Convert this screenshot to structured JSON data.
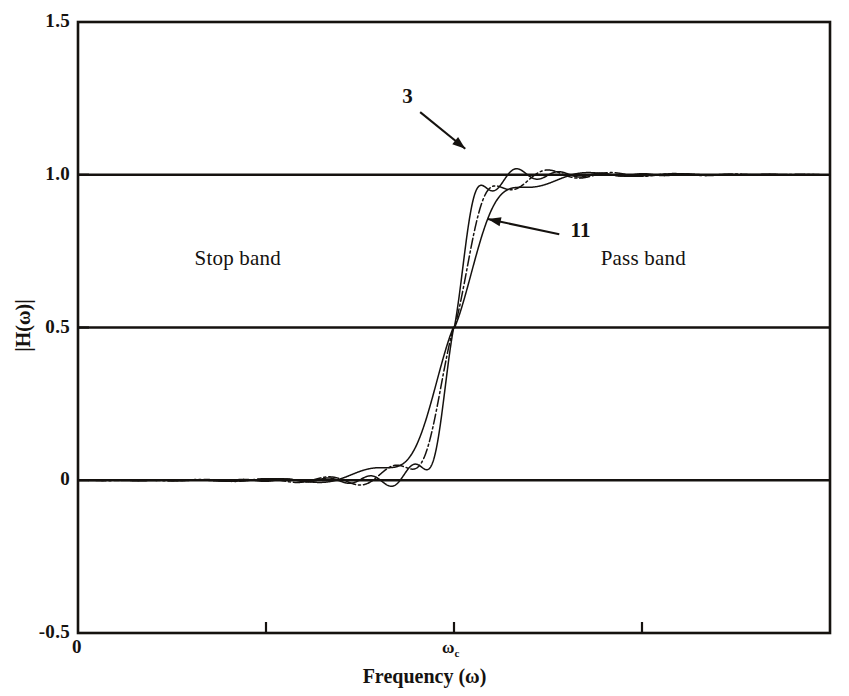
{
  "figure": {
    "title": "",
    "background": "#ffffff",
    "ink_color": "#15120f"
  },
  "axes": {
    "x_title": "Frequency (ω)",
    "y_title": "|H(ω)|",
    "y_ticks": [
      "1.5",
      "1.0",
      "0.5",
      "0",
      "-0.5"
    ],
    "y_tick_values": [
      1.5,
      1.0,
      0.5,
      0.0,
      -0.5
    ],
    "x_origin_label": "0",
    "x_cut_label_base": "ω",
    "x_cut_label_sub": "c",
    "x_ticks_positions": [
      0.0,
      0.25,
      0.5,
      0.75,
      1.0
    ],
    "x_ticks_labeled": [
      "0",
      "",
      "ωc",
      "",
      ""
    ]
  },
  "annotations": {
    "stop_band": "Stop band",
    "pass_band": "Pass band",
    "curve_label_short": "3",
    "curve_label_long": "11"
  },
  "chart_data": {
    "type": "line",
    "title": "",
    "xlabel": "Frequency (ω)",
    "ylabel": "|H(ω)|",
    "xlim": [
      0,
      1
    ],
    "ylim": [
      -0.5,
      1.5
    ],
    "grid": "horizontal-lines-at-1.0-0.5-0.0",
    "legend": "inline-arrow-annotations",
    "xticks": [
      0,
      0.25,
      0.5,
      0.75,
      1
    ],
    "xticklabels": [
      "0",
      "",
      "ωc",
      "",
      ""
    ],
    "yticks": [
      -0.5,
      0,
      0.5,
      1.0,
      1.5
    ],
    "yticklabels": [
      "-0.5",
      "0",
      "0.5",
      "1.0",
      "1.5"
    ],
    "omega_c_normalized": 0.5,
    "series": [
      {
        "name": "3",
        "label": "3",
        "order": 3,
        "lobes": 3,
        "transition_halfwidth": 0.06,
        "ripple_amplitude": 0.091,
        "ripple_decay": 1.45,
        "style": "solid",
        "arrow_from": [
          0.455,
          1.205
        ],
        "arrow_to": [
          0.515,
          1.085
        ]
      },
      {
        "name": "7",
        "label": "",
        "order": 7,
        "lobes": 7,
        "transition_halfwidth": 0.042,
        "ripple_amplitude": 0.089,
        "ripple_decay": 1.45,
        "style": "dashdot",
        "arrow_from": null,
        "arrow_to": null
      },
      {
        "name": "11",
        "label": "11",
        "order": 11,
        "lobes": 11,
        "transition_halfwidth": 0.028,
        "ripple_amplitude": 0.088,
        "ripple_decay": 1.45,
        "style": "solid",
        "arrow_from": [
          0.64,
          0.805
        ],
        "arrow_to": [
          0.545,
          0.855
        ]
      }
    ],
    "reference_levels": [
      {
        "value": 1.0,
        "style": "solid-heavy"
      },
      {
        "value": 0.5,
        "style": "solid-heavy"
      },
      {
        "value": 0.0,
        "style": "solid-heavy"
      }
    ]
  }
}
